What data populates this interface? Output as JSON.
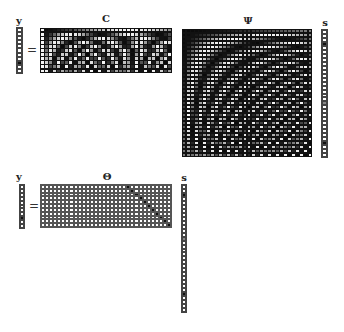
{
  "top": {
    "y_label": "y",
    "equals": "=",
    "C_label": "C",
    "Psi_label": "Ψ",
    "s_label": "s",
    "y": {
      "length": 11,
      "dark": [
        8
      ],
      "gray": []
    },
    "C": {
      "rows": 11,
      "cols": 32,
      "sample_rows": [
        1,
        4,
        6,
        9,
        12,
        14,
        17,
        20,
        23,
        26,
        29
      ]
    },
    "Psi": {
      "size": 32
    },
    "s": {
      "length": 32,
      "dark": [
        3,
        28
      ],
      "gray": [
        18
      ]
    }
  },
  "bottom": {
    "y_label": "y",
    "equals": "=",
    "Theta_label": "Θ",
    "s_label": "s",
    "y": {
      "length": 11,
      "dark": [
        8
      ],
      "gray": []
    },
    "Theta": {
      "rows": 11,
      "cols": 32,
      "diag_start_col": 21
    },
    "s": {
      "length": 32,
      "dark": [
        2,
        27
      ],
      "gray": [
        13
      ]
    }
  },
  "colors": {
    "dark": "#111111",
    "light": "#ffffff",
    "grid": "#555555"
  }
}
